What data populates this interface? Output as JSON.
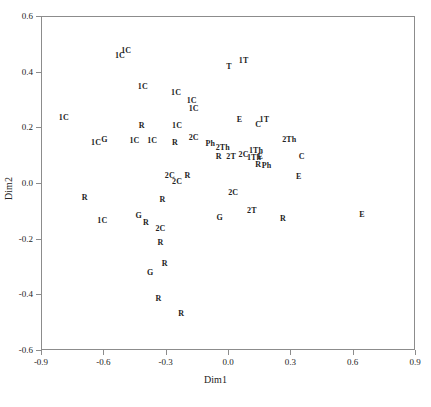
{
  "chart_data": {
    "type": "scatter",
    "title": "",
    "xlabel": "Dim1",
    "ylabel": "Dim2",
    "xlim": [
      -0.9,
      0.9
    ],
    "ylim": [
      -0.6,
      0.6
    ],
    "xticks": [
      "-0.9",
      "-0.6",
      "-0.3",
      "0.0",
      "0.3",
      "0.6",
      "0.9"
    ],
    "xtick_values": [
      -0.9,
      -0.6,
      -0.3,
      0.0,
      0.3,
      0.6,
      0.9
    ],
    "yticks": [
      "0.6",
      "0.4",
      "0.2",
      "0.0",
      "-0.2",
      "-0.4",
      "-0.6"
    ],
    "ytick_values": [
      0.6,
      0.4,
      0.2,
      0.0,
      -0.2,
      -0.4,
      -0.6
    ],
    "grid": false,
    "legend": false,
    "marker_style": "text-label",
    "point_label_groups": [
      "1C",
      "2C",
      "1T",
      "2T",
      "T",
      "C",
      "E",
      "G",
      "R",
      "Ph",
      "1Th",
      "2Th"
    ],
    "points": [
      {
        "label": "1C",
        "x": -0.52,
        "y": 0.455
      },
      {
        "label": "1C",
        "x": -0.49,
        "y": 0.475
      },
      {
        "label": "1C",
        "x": -0.41,
        "y": 0.345
      },
      {
        "label": "1C",
        "x": -0.25,
        "y": 0.325
      },
      {
        "label": "1C",
        "x": -0.175,
        "y": 0.295
      },
      {
        "label": "1C",
        "x": -0.165,
        "y": 0.265
      },
      {
        "label": "1C",
        "x": -0.79,
        "y": 0.235
      },
      {
        "label": "R",
        "x": -0.415,
        "y": 0.205
      },
      {
        "label": "1C",
        "x": -0.245,
        "y": 0.205
      },
      {
        "label": "E",
        "x": 0.055,
        "y": 0.225
      },
      {
        "label": "C",
        "x": 0.145,
        "y": 0.21
      },
      {
        "label": "1T",
        "x": 0.175,
        "y": 0.225
      },
      {
        "label": "1T",
        "x": 0.075,
        "y": 0.44
      },
      {
        "label": "T",
        "x": 0.005,
        "y": 0.415
      },
      {
        "label": "1C",
        "x": -0.635,
        "y": 0.145
      },
      {
        "label": "G",
        "x": -0.595,
        "y": 0.155
      },
      {
        "label": "1C",
        "x": -0.45,
        "y": 0.15
      },
      {
        "label": "1C",
        "x": -0.365,
        "y": 0.15
      },
      {
        "label": "R",
        "x": -0.255,
        "y": 0.145
      },
      {
        "label": "2C",
        "x": -0.165,
        "y": 0.16
      },
      {
        "label": "Ph",
        "x": -0.085,
        "y": 0.14
      },
      {
        "label": "2Th",
        "x": -0.025,
        "y": 0.125
      },
      {
        "label": "2Th",
        "x": 0.295,
        "y": 0.155
      },
      {
        "label": "R",
        "x": -0.045,
        "y": 0.095
      },
      {
        "label": "2T",
        "x": 0.015,
        "y": 0.095
      },
      {
        "label": "2C",
        "x": 0.075,
        "y": 0.1
      },
      {
        "label": "1Th",
        "x": 0.135,
        "y": 0.115
      },
      {
        "label": "1Th",
        "x": 0.125,
        "y": 0.09
      },
      {
        "label": "E",
        "x": 0.155,
        "y": 0.095
      },
      {
        "label": "R",
        "x": 0.145,
        "y": 0.065
      },
      {
        "label": "Ph",
        "x": 0.185,
        "y": 0.06
      },
      {
        "label": "C",
        "x": 0.355,
        "y": 0.095
      },
      {
        "label": "2C",
        "x": -0.28,
        "y": 0.025
      },
      {
        "label": "2C",
        "x": -0.245,
        "y": 0.005
      },
      {
        "label": "R",
        "x": -0.195,
        "y": 0.025
      },
      {
        "label": "E",
        "x": 0.34,
        "y": 0.02
      },
      {
        "label": "2C",
        "x": 0.025,
        "y": -0.035
      },
      {
        "label": "R",
        "x": -0.69,
        "y": -0.055
      },
      {
        "label": "R",
        "x": -0.315,
        "y": -0.06
      },
      {
        "label": "2T",
        "x": 0.115,
        "y": -0.1
      },
      {
        "label": "1C",
        "x": -0.605,
        "y": -0.135
      },
      {
        "label": "G",
        "x": -0.43,
        "y": -0.12
      },
      {
        "label": "G",
        "x": -0.04,
        "y": -0.125
      },
      {
        "label": "R",
        "x": -0.395,
        "y": -0.145
      },
      {
        "label": "R",
        "x": 0.265,
        "y": -0.13
      },
      {
        "label": "E",
        "x": 0.645,
        "y": -0.115
      },
      {
        "label": "2C",
        "x": -0.325,
        "y": -0.165
      },
      {
        "label": "R",
        "x": -0.325,
        "y": -0.215
      },
      {
        "label": "R",
        "x": -0.305,
        "y": -0.29
      },
      {
        "label": "G",
        "x": -0.375,
        "y": -0.325
      },
      {
        "label": "R",
        "x": -0.335,
        "y": -0.415
      },
      {
        "label": "R",
        "x": -0.225,
        "y": -0.47
      }
    ]
  },
  "axes": {
    "xlabel": "Dim1",
    "ylabel": "Dim2"
  }
}
